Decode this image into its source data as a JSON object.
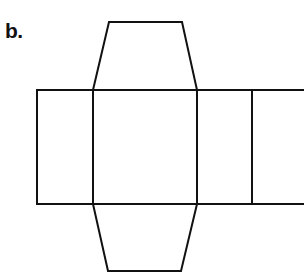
{
  "label": "b.",
  "figure": {
    "stroke_color": "#111111",
    "faces": [
      {
        "name": "left-rectangle",
        "shape": "rectangle"
      },
      {
        "name": "center-rectangle",
        "shape": "rectangle"
      },
      {
        "name": "right-rectangle-1",
        "shape": "rectangle"
      },
      {
        "name": "right-rectangle-2",
        "shape": "rectangle"
      },
      {
        "name": "top-trapezoid",
        "shape": "trapezoid"
      },
      {
        "name": "bottom-trapezoid",
        "shape": "trapezoid"
      }
    ]
  }
}
